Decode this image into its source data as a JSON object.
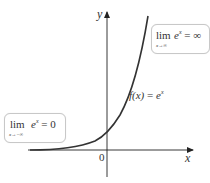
{
  "figure": {
    "axes": {
      "x_label": "x",
      "y_label": "y",
      "origin_label": "0"
    },
    "curve_label": {
      "func": "f(x)",
      "eq": " = ",
      "base": "e",
      "exp": "x"
    },
    "limit_right": {
      "word": "lim",
      "sub": "x→∞",
      "base": "e",
      "exp": "x",
      "rhs": " = ∞"
    },
    "limit_left": {
      "word": "lim",
      "sub": "x→−∞",
      "base": "e",
      "exp": "x",
      "rhs": " = 0"
    },
    "colors": {
      "curve": "#333333",
      "axis": "#222222",
      "box_border": "#c8c8c8"
    }
  }
}
